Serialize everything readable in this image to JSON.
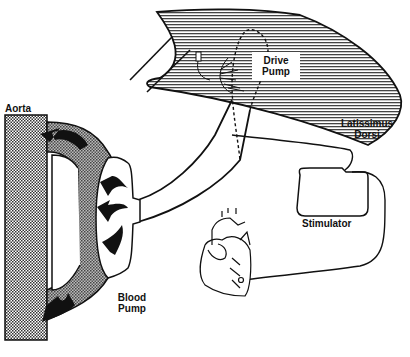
{
  "figure": {
    "type": "anatomical schematic",
    "colors": {
      "ink": "#111111",
      "stipple": "#8a8a8a",
      "background": "#ffffff"
    }
  },
  "labels": {
    "aorta": "Aorta",
    "blood_pump_line1": "Blood",
    "blood_pump_line2": "Pump",
    "drive_pump_line1": "Drive",
    "drive_pump_line2": "Pump",
    "latissimus_line1": "Latissimus",
    "latissimus_line2": "Dorsi",
    "stimulator": "Stimulator"
  },
  "components": [
    {
      "id": "aorta",
      "label": "Aorta",
      "fill": "stippled"
    },
    {
      "id": "blood-pump",
      "label": "Blood Pump",
      "arrows": 5
    },
    {
      "id": "drive-pump",
      "label": "Drive Pump",
      "outline": "dashed"
    },
    {
      "id": "latissimus-dorsi",
      "label": "Latissimus Dorsi",
      "fill": "hatched"
    },
    {
      "id": "stimulator",
      "label": "Stimulator"
    },
    {
      "id": "heart",
      "label": ""
    }
  ],
  "connections": [
    {
      "from": "blood-pump",
      "to": "drive-pump",
      "kind": "tube"
    },
    {
      "from": "stimulator",
      "to": "latissimus-dorsi",
      "kind": "lead"
    },
    {
      "from": "stimulator",
      "to": "heart",
      "kind": "lead"
    }
  ]
}
